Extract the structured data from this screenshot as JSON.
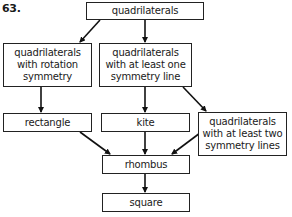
{
  "problem_number": "63.",
  "nodes": {
    "quadrilaterals": "quadrilaterals",
    "rotation": [
      "quadrilaterals",
      "with rotation",
      "symmetry"
    ],
    "one_line": [
      "quadrilaterals",
      "with at least one",
      "symmetry line"
    ],
    "rectangle": "rectangle",
    "kite": "kite",
    "two_lines": [
      "quadrilaterals",
      "with at least two",
      "symmetry lines"
    ],
    "rhombus": "rhombus",
    "square": "square"
  },
  "edges": [
    [
      "quadrilaterals",
      "rotation"
    ],
    [
      "quadrilaterals",
      "one_line"
    ],
    [
      "rotation",
      "rectangle"
    ],
    [
      "one_line",
      "kite"
    ],
    [
      "one_line",
      "two_lines"
    ],
    [
      "rectangle",
      "rhombus"
    ],
    [
      "kite",
      "rhombus"
    ],
    [
      "two_lines",
      "rhombus"
    ],
    [
      "rhombus",
      "square"
    ]
  ]
}
